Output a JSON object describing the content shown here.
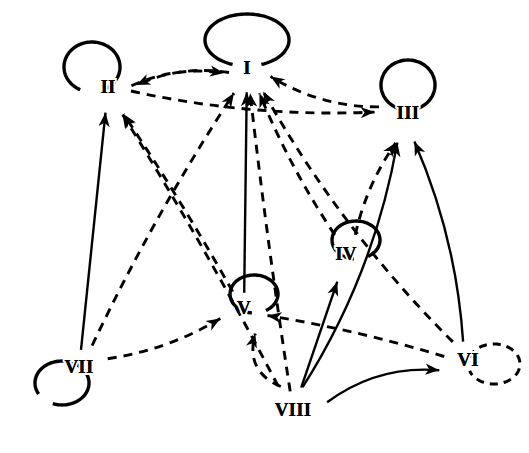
{
  "figure": {
    "type": "directed-graph",
    "title": "",
    "background_color": "#ffffff",
    "ink_color": "#000000"
  },
  "nodes": [
    {
      "id": "I",
      "label": "I",
      "x": 247,
      "y": 70,
      "loop": "solid",
      "loop_position": "top",
      "loop_rx": 42,
      "loop_ry": 26
    },
    {
      "id": "II",
      "label": "II",
      "x": 108,
      "y": 89,
      "loop": "solid",
      "loop_position": "top-left",
      "loop_rx": 28,
      "loop_ry": 25
    },
    {
      "id": "III",
      "label": "III",
      "x": 408,
      "y": 115,
      "loop": "solid",
      "loop_position": "top",
      "loop_rx": 27,
      "loop_ry": 25
    },
    {
      "id": "IV",
      "label": "IV",
      "x": 346,
      "y": 256,
      "loop": "solid",
      "loop_position": "top-right",
      "loop_rx": 24,
      "loop_ry": 19
    },
    {
      "id": "V",
      "label": "V",
      "x": 244,
      "y": 310,
      "loop": "solid",
      "loop_position": "top-right",
      "loop_rx": 24,
      "loop_ry": 19
    },
    {
      "id": "VI",
      "label": "VI",
      "x": 468,
      "y": 362,
      "loop": "dashed",
      "loop_position": "right",
      "loop_rx": 26,
      "loop_ry": 20
    },
    {
      "id": "VII",
      "label": "VII",
      "x": 79,
      "y": 369,
      "loop": "solid",
      "loop_position": "bottom-left",
      "loop_rx": 27,
      "loop_ry": 22
    },
    {
      "id": "VIII",
      "label": "VIII",
      "x": 293,
      "y": 412,
      "loop": "none",
      "loop_position": "",
      "loop_rx": 0,
      "loop_ry": 0
    }
  ],
  "edges": [
    {
      "from": "II",
      "to": "I",
      "style": "dashed",
      "arrow": "target"
    },
    {
      "from": "I",
      "to": "II",
      "style": "dashed",
      "arrow": "target"
    },
    {
      "from": "III",
      "to": "I",
      "style": "dashed",
      "arrow": "target"
    },
    {
      "from": "II",
      "to": "III",
      "style": "dashed",
      "arrow": "target"
    },
    {
      "from": "V",
      "to": "I",
      "style": "solid",
      "arrow": "target"
    },
    {
      "from": "IV",
      "to": "I",
      "style": "dashed",
      "arrow": "target"
    },
    {
      "from": "VIII",
      "to": "I",
      "style": "dashed",
      "arrow": "target"
    },
    {
      "from": "VII",
      "to": "I",
      "style": "dashed",
      "arrow": "target"
    },
    {
      "from": "VI",
      "to": "I",
      "style": "dashed",
      "arrow": "target"
    },
    {
      "from": "VII",
      "to": "II",
      "style": "solid",
      "arrow": "target"
    },
    {
      "from": "VIII",
      "to": "II",
      "style": "dashed",
      "arrow": "target"
    },
    {
      "from": "V",
      "to": "II",
      "style": "dashed",
      "arrow": "target"
    },
    {
      "from": "IV",
      "to": "III",
      "style": "dashed",
      "arrow": "target"
    },
    {
      "from": "VIII",
      "to": "III",
      "style": "solid",
      "arrow": "target"
    },
    {
      "from": "VI",
      "to": "III",
      "style": "solid",
      "arrow": "target"
    },
    {
      "from": "VIII",
      "to": "IV",
      "style": "solid",
      "arrow": "target"
    },
    {
      "from": "VIII",
      "to": "V",
      "style": "dashed",
      "arrow": "target"
    },
    {
      "from": "VII",
      "to": "V",
      "style": "dashed",
      "arrow": "target"
    },
    {
      "from": "VI",
      "to": "V",
      "style": "dashed",
      "arrow": "target"
    },
    {
      "from": "VIII",
      "to": "VI",
      "style": "solid",
      "arrow": "target"
    }
  ],
  "self_loops": [
    {
      "node": "I",
      "style": "solid"
    },
    {
      "node": "II",
      "style": "solid"
    },
    {
      "node": "III",
      "style": "solid"
    },
    {
      "node": "IV",
      "style": "solid"
    },
    {
      "node": "V",
      "style": "solid"
    },
    {
      "node": "VI",
      "style": "dashed"
    },
    {
      "node": "VII",
      "style": "solid"
    }
  ],
  "legend": {
    "solid_meaning": "",
    "dashed_meaning": ""
  }
}
